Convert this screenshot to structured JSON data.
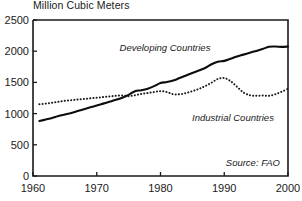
{
  "chart_data": {
    "type": "line",
    "title": "Million Cubic Meters",
    "xlabel": "",
    "ylabel": "",
    "xlim": [
      1960,
      2000
    ],
    "ylim": [
      0,
      2500
    ],
    "xticks": [
      "1960",
      "1970",
      "1980",
      "1990",
      "2000"
    ],
    "yticks": [
      "0",
      "500",
      "1000",
      "1500",
      "2000",
      "2500"
    ],
    "grid": false,
    "legend_position": "inline-annotations",
    "annotations": {
      "developing_label": "Developing Countries",
      "industrial_label": "Industrial Countries",
      "source": "Source: FAO"
    },
    "x": [
      1961,
      1962,
      1963,
      1964,
      1965,
      1966,
      1967,
      1968,
      1969,
      1970,
      1971,
      1972,
      1973,
      1974,
      1975,
      1976,
      1977,
      1978,
      1979,
      1980,
      1981,
      1982,
      1983,
      1984,
      1985,
      1986,
      1987,
      1988,
      1989,
      1990,
      1991,
      1992,
      1993,
      1994,
      1995,
      1996,
      1997,
      1998,
      1999,
      2000
    ],
    "series": [
      {
        "name": "Developing Countries",
        "style": "solid",
        "color": "#0d0d0d",
        "values": [
          880,
          905,
          930,
          960,
          985,
          1010,
          1040,
          1070,
          1100,
          1130,
          1160,
          1190,
          1220,
          1255,
          1300,
          1360,
          1375,
          1400,
          1440,
          1490,
          1505,
          1530,
          1570,
          1610,
          1650,
          1690,
          1730,
          1790,
          1830,
          1845,
          1880,
          1915,
          1945,
          1975,
          2005,
          2035,
          2070,
          2075,
          2070,
          2075
        ]
      },
      {
        "name": "Industrial Countries",
        "style": "dotted",
        "color": "#1a1a1a",
        "values": [
          1150,
          1160,
          1175,
          1190,
          1205,
          1215,
          1225,
          1235,
          1245,
          1255,
          1265,
          1275,
          1285,
          1290,
          1280,
          1295,
          1315,
          1330,
          1345,
          1360,
          1345,
          1310,
          1310,
          1330,
          1360,
          1395,
          1440,
          1495,
          1555,
          1570,
          1520,
          1430,
          1340,
          1295,
          1285,
          1290,
          1285,
          1310,
          1350,
          1400
        ]
      }
    ]
  }
}
